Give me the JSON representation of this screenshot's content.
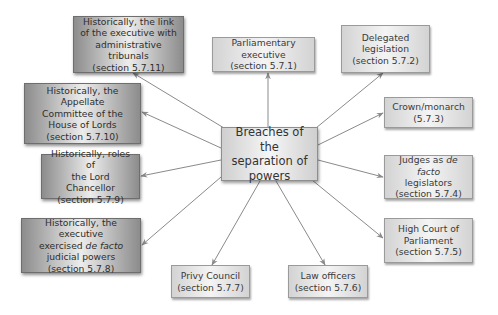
{
  "diagram": {
    "center": {
      "lines": [
        "Breaches of the",
        "separation of",
        "powers"
      ]
    },
    "nodes": {
      "parliamentary_executive": {
        "lines": [
          "Parliamentary executive",
          "(section 5.7.1)"
        ]
      },
      "delegated_legislation": {
        "lines": [
          "Delegated",
          "legislation",
          "(section 5.7.2)"
        ]
      },
      "crown_monarch": {
        "lines": [
          "Crown/monarch",
          "(5.7.3)"
        ]
      },
      "judges_de_facto": {
        "line1_pre": "Judges as ",
        "line1_em": "de facto",
        "lines": [
          "legislators",
          "(section 5.7.4)"
        ]
      },
      "high_court": {
        "lines": [
          "High Court of",
          "Parliament",
          "(section 5.7.5)"
        ]
      },
      "law_officers": {
        "lines": [
          "Law officers",
          "(section 5.7.6)"
        ]
      },
      "privy_council": {
        "lines": [
          "Privy Council",
          "(section 5.7.7)"
        ]
      },
      "executive_judicial": {
        "line1": "Historically, the executive",
        "line2_pre": "exercised ",
        "line2_em": "de facto",
        "lines": [
          "judicial powers",
          "(section 5.7.8)"
        ]
      },
      "lord_chancellor": {
        "lines": [
          "Historically, roles of",
          "the Lord Chancellor",
          "(section 5.7.9)"
        ]
      },
      "appellate_committee": {
        "lines": [
          "Historically, the Appellate",
          "Committee of the",
          "House of Lords",
          "(section 5.7.10)"
        ]
      },
      "admin_tribunals": {
        "lines": [
          "Historically, the link",
          "of the executive with",
          "administrative tribunals",
          "(section 5.7.11)"
        ]
      }
    },
    "colors": {
      "arrow": "#8a8a8a",
      "light_box_edge": "#d3d3d3",
      "dark_box_edge": "#8c8c8c",
      "text": "#3a3a3a"
    }
  }
}
